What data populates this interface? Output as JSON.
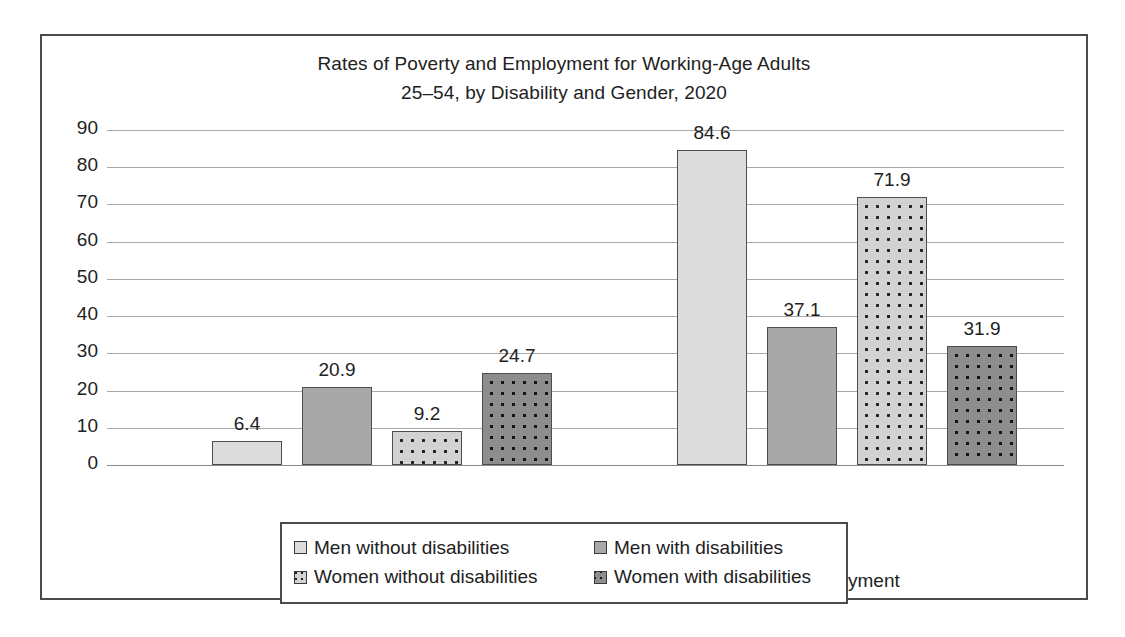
{
  "chart_data": {
    "type": "bar",
    "title": "Rates of Poverty and Employment for Working-Age Adults 25–54, by Disability and Gender, 2020",
    "title_line1": "Rates of Poverty and Employment for Working-Age Adults",
    "title_line2": "25–54, by Disability and Gender, 2020",
    "xlabel": "",
    "ylabel": "",
    "ylim": [
      0,
      90
    ],
    "yticks": [
      0,
      10,
      20,
      30,
      40,
      50,
      60,
      70,
      80,
      90
    ],
    "ytick_labels": [
      "0",
      "10",
      "20",
      "30",
      "40",
      "50",
      "60",
      "70",
      "80",
      "90"
    ],
    "grid": true,
    "legend_position": "bottom",
    "categories": [
      "Poverty",
      "Employment"
    ],
    "series": [
      {
        "name": "Men without disabilities",
        "values": [
          6.4,
          84.6
        ],
        "labels": [
          "6.4",
          "84.6"
        ],
        "color": "#dcdcdc",
        "pattern": "solid"
      },
      {
        "name": "Men with disabilities",
        "values": [
          20.9,
          37.1
        ],
        "labels": [
          "20.9",
          "37.1"
        ],
        "color": "#a8a8a8",
        "pattern": "solid"
      },
      {
        "name": "Women without disabilities",
        "values": [
          9.2,
          71.9
        ],
        "labels": [
          "9.2",
          "71.9"
        ],
        "color": "#d2d2d2",
        "pattern": "dots"
      },
      {
        "name": "Women with disabilities",
        "values": [
          24.7,
          31.9
        ],
        "labels": [
          "24.7",
          "31.9"
        ],
        "color": "#8d8d8d",
        "pattern": "dots"
      }
    ]
  },
  "legend": {
    "items": [
      "Men without disabilities",
      "Men with disabilities",
      "Women without disabilities",
      "Women with disabilities"
    ]
  }
}
